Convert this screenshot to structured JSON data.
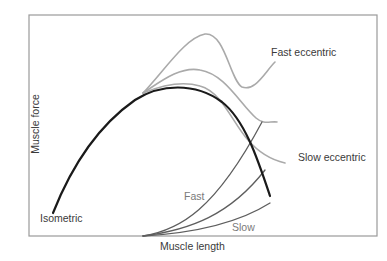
{
  "chart_data": {
    "type": "line",
    "title": "",
    "xlabel": "Muscle length",
    "ylabel": "Muscle force",
    "grid": false,
    "legend": "inline labels",
    "axes_box": {
      "left": 29,
      "top": 15,
      "right": 377,
      "bottom": 236
    },
    "series": [
      {
        "name": "Isometric",
        "color": "#1a1a1a",
        "width": 2.2,
        "path": "M53,213 C70,170 95,128 135,100 C160,84 195,82 222,102 C245,120 258,160 270,196"
      },
      {
        "name": "Fast eccentric",
        "color": "#aaaaaa",
        "width": 1.6,
        "path": "M143,93 C165,70 185,38 205,34 C225,32 230,80 242,87 C255,92 265,72 275,62"
      },
      {
        "name": "Medium eccentric",
        "color": "#aaaaaa",
        "width": 1.6,
        "path": "M143,93 C160,82 180,66 200,70 C225,74 240,104 256,118 C264,125 270,121 277,122"
      },
      {
        "name": "Slow eccentric",
        "color": "#aaaaaa",
        "width": 1.6,
        "path": "M143,93 C160,86 180,80 200,86 C222,92 232,122 248,140 C260,154 272,160 285,163"
      },
      {
        "name": "Fast",
        "color": "#5e5e5e",
        "width": 1.3,
        "path": "M143,236 C180,230 215,210 262,122"
      },
      {
        "name": "Medium",
        "color": "#5e5e5e",
        "width": 1.3,
        "path": "M143,236 C190,230 230,215 265,170"
      },
      {
        "name": "Slow",
        "color": "#5e5e5e",
        "width": 1.3,
        "path": "M143,236 C195,233 240,222 270,203"
      }
    ],
    "annotations": [
      {
        "text": "Fast eccentric",
        "x": 271,
        "y": 47
      },
      {
        "text": "Slow eccentric",
        "x": 298,
        "y": 152
      },
      {
        "text": "Isometric",
        "x": 40,
        "y": 213
      },
      {
        "text": "Fast",
        "x": 184,
        "y": 191
      },
      {
        "text": "Slow",
        "x": 232,
        "y": 222
      }
    ]
  },
  "labels": {
    "fast_eccentric": "Fast eccentric",
    "slow_eccentric": "Slow eccentric",
    "isometric": "Isometric",
    "fast": "Fast",
    "slow": "Slow",
    "xlabel": "Muscle length",
    "ylabel": "Muscle force"
  }
}
